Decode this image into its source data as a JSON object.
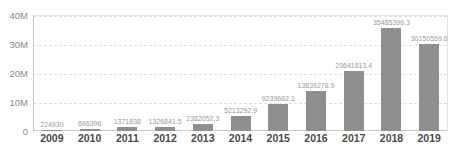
{
  "chart_data": {
    "type": "bar",
    "title": "",
    "xlabel": "",
    "ylabel": "",
    "categories": [
      "2009",
      "2010",
      "2011",
      "2012",
      "2013",
      "2014",
      "2015",
      "2016",
      "2017",
      "2018",
      "2019"
    ],
    "values": [
      224930,
      696396,
      1371838,
      1326841.5,
      2382052.3,
      5213292.9,
      9239662.1,
      13639278.9,
      20641813.4,
      35485396.3,
      30150559.6
    ],
    "value_labels": [
      "224930",
      "696396",
      "1371838",
      "1326841.5",
      "2382052.3",
      "5213292.9",
      "9239662.1",
      "13639278.9",
      "20641813.4",
      "35485396.3",
      "30150559.6"
    ],
    "ylim": [
      0,
      40000000
    ],
    "yticks": [
      {
        "label": "40M",
        "value": 40000000
      },
      {
        "label": "30M",
        "value": 30000000
      },
      {
        "label": "20M",
        "value": 20000000
      },
      {
        "label": "10M",
        "value": 10000000
      },
      {
        "label": "0",
        "value": 0
      }
    ],
    "grid": "horizontal-dashed",
    "legend": "none",
    "bar_color": "#8f8f8f",
    "axis_text_color": "#8a8a8a",
    "category_text_color": "#4a4a4a",
    "value_label_color": "#9a9a9a"
  }
}
